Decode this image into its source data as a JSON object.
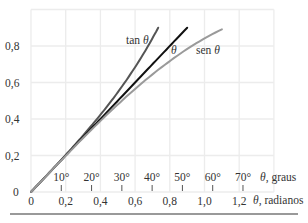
{
  "chart_data": {
    "type": "line",
    "title": "",
    "xlabel": "θ, radianos",
    "xlabel_secondary": "θ, graus",
    "ylabel": "",
    "xlim": [
      0,
      1.4
    ],
    "ylim": [
      0,
      1.0
    ],
    "grid": true,
    "x_ticks": [
      "0",
      "0,2",
      "0,4",
      "0,6",
      "0,8",
      "1,0",
      "1,2"
    ],
    "x_tick_values": [
      0,
      0.2,
      0.4,
      0.6,
      0.8,
      1.0,
      1.2
    ],
    "x_ticks_degrees": [
      "10°",
      "20°",
      "30°",
      "40°",
      "50°",
      "60°",
      "70°"
    ],
    "x_ticks_degrees_values": [
      10,
      20,
      30,
      40,
      50,
      60,
      70
    ],
    "y_ticks": [
      "0",
      "0,2",
      "0,4",
      "0,6",
      "0,8"
    ],
    "y_tick_values": [
      0,
      0.2,
      0.4,
      0.6,
      0.8
    ],
    "series": [
      {
        "name": "tan θ",
        "color": "#555555",
        "x": [
          0,
          0.1,
          0.2,
          0.3,
          0.4,
          0.5,
          0.6,
          0.7,
          0.733
        ],
        "y": [
          0,
          0.1,
          0.203,
          0.309,
          0.423,
          0.546,
          0.684,
          0.842,
          0.9
        ]
      },
      {
        "name": "θ",
        "color": "#111111",
        "x": [
          0,
          0.3,
          0.6,
          0.9
        ],
        "y": [
          0,
          0.3,
          0.6,
          0.9
        ]
      },
      {
        "name": "sen θ",
        "color": "#9a9a9a",
        "x": [
          0,
          0.1,
          0.2,
          0.3,
          0.4,
          0.5,
          0.6,
          0.7,
          0.8,
          0.9,
          1.0,
          1.1
        ],
        "y": [
          0,
          0.1,
          0.199,
          0.296,
          0.389,
          0.479,
          0.565,
          0.644,
          0.717,
          0.783,
          0.841,
          0.891
        ]
      }
    ],
    "annotations": [
      {
        "text": "tan θ",
        "x": 0.55,
        "y": 0.79
      },
      {
        "text": "θ",
        "x": 0.79,
        "y": 0.79
      },
      {
        "text": "sen θ",
        "x": 0.98,
        "y": 0.79
      }
    ]
  },
  "labels": {
    "tan": "tan",
    "theta": "θ",
    "sen": "sen",
    "graus": ", graus",
    "radianos": ", radianos",
    "origin_y": "0"
  }
}
